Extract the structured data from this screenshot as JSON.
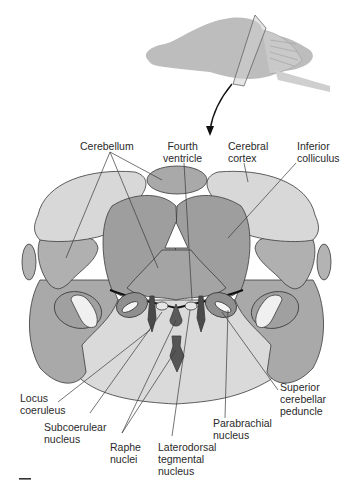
{
  "diagram": {
    "type": "anatomical-cross-section",
    "colors": {
      "light_gray": "#d9d9d9",
      "mid_gray": "#a8a8a8",
      "dark_gray": "#8f8f8f",
      "darkest": "#4a4a4a",
      "white_fill": "#f4f4f4",
      "outline": "#3a3a3a"
    }
  },
  "labels": {
    "cerebellum": "Cerebellum",
    "fourth_ventricle": "Fourth\nventricle",
    "cerebral_cortex": "Cerebral\ncortex",
    "inferior_colliculus": "Inferior\ncolliculus",
    "locus_coeruleus": "Locus\ncoeruleus",
    "subcoerulear_nucleus": "Subcoerulear\nnucleus",
    "raphe_nuclei": "Raphe\nnuclei",
    "laterodorsal_tegmental_nucleus": "Laterodorsal\ntegmental\nnucleus",
    "parabrachial_nucleus": "Parabrachial\nnucleus",
    "superior_cerebellar_peduncle": "Superior\ncerebellar\npeduncle"
  }
}
